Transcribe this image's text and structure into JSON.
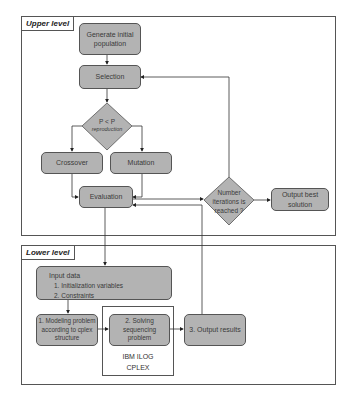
{
  "upper_level": {
    "label": "Upper level",
    "nodes": {
      "generate": "Generate initial population",
      "generate_l1": "Generate initial",
      "generate_l2": "population",
      "selection": "Selection",
      "decision_l1": "P < P",
      "decision_l2": "reproduction",
      "crossover": "Crossover",
      "mutation": "Mutation",
      "evaluation": "Evaluation",
      "iter_l1": "Number",
      "iter_l2": "iterations is",
      "iter_l3": "reached ?",
      "output_best_l1": "Output best",
      "output_best_l2": "solution"
    }
  },
  "lower_level": {
    "label": "Lower level",
    "input": {
      "title": "Input data",
      "items": [
        "1.   Initialization variables",
        "2.   Constraints"
      ]
    },
    "modeling_l1": "1. Modeling problem",
    "modeling_l2": "according to cplex",
    "modeling_l3": "structure",
    "solving_l1": "2. Solving",
    "solving_l2": "sequencing",
    "solving_l3": "problem",
    "output_results": "3. Output results",
    "solver_l1": "IBM ILOG",
    "solver_l2": "CPLEX"
  },
  "colors": {
    "node_fill": "#b3b3b3",
    "stroke": "#555555",
    "background": "#ffffff"
  }
}
